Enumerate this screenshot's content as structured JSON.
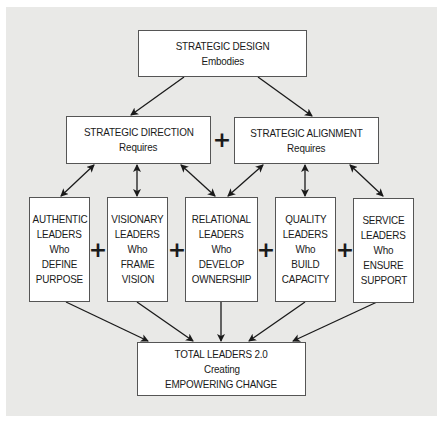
{
  "diagram": {
    "top": {
      "title": "STRATEGIC DESIGN",
      "subtitle": "Embodies"
    },
    "direction": {
      "title": "STRATEGIC DIRECTION",
      "subtitle": "Requires"
    },
    "alignment": {
      "title": "STRATEGIC ALIGNMENT",
      "subtitle": "Requires"
    },
    "plus_symbol": "+",
    "leaders": [
      {
        "lines": [
          "AUTHENTIC",
          "LEADERS",
          "Who",
          "DEFINE",
          "PURPOSE"
        ]
      },
      {
        "lines": [
          "VISIONARY",
          "LEADERS",
          "Who",
          "FRAME",
          "VISION"
        ]
      },
      {
        "lines": [
          "RELATIONAL",
          "LEADERS",
          "Who",
          "DEVELOP",
          "OWNERSHIP"
        ]
      },
      {
        "lines": [
          "QUALITY",
          "LEADERS",
          "Who",
          "BUILD",
          "CAPACITY"
        ]
      },
      {
        "lines": [
          "SERVICE",
          "LEADERS",
          "Who",
          "ENSURE",
          "SUPPORT"
        ]
      }
    ],
    "bottom": {
      "lines": [
        "TOTAL LEADERS 2.0",
        "Creating",
        "EMPOWERING CHANGE"
      ]
    },
    "colors": {
      "panel": "#e9e9e7",
      "box": "#ffffff",
      "stroke": "#1a1a1a"
    }
  }
}
